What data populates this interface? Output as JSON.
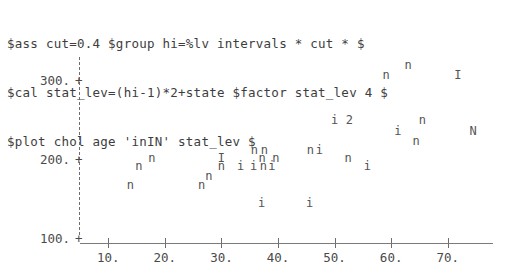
{
  "terminal": {
    "lines": [
      "$ass cut=0.4 $group hi=%lv intervals * cut * $",
      "$cal stat_lev=(hi-1)*2+state $factor stat_lev 4 $",
      "$plot chol age 'inIN' stat_lev $"
    ]
  },
  "chart_data": {
    "type": "scatter",
    "title": "",
    "xlabel": "age",
    "ylabel": "chol",
    "grid": false,
    "legend": "none",
    "plot_symbols": [
      "i",
      "n",
      "I",
      "N",
      "2"
    ],
    "xlim": [
      5,
      78
    ],
    "ylim": [
      95,
      330
    ],
    "xticks": [
      10,
      20,
      30,
      40,
      50,
      60,
      70
    ],
    "xticklabels": [
      "10.",
      "20.",
      "30.",
      "40.",
      "50.",
      "60.",
      "70."
    ],
    "yticks": [
      100,
      200,
      300
    ],
    "yticklabels": [
      "100.",
      "200.",
      "300."
    ],
    "tick_glyph": "+",
    "points": [
      {
        "symbol": "n",
        "x": 63.0,
        "y": 320
      },
      {
        "symbol": "n",
        "x": 59.1,
        "y": 307
      },
      {
        "symbol": "I",
        "x": 71.8,
        "y": 307
      },
      {
        "symbol": "i",
        "x": 50.0,
        "y": 250
      },
      {
        "symbol": "2",
        "x": 52.6,
        "y": 250
      },
      {
        "symbol": "n",
        "x": 65.5,
        "y": 250
      },
      {
        "symbol": "i",
        "x": 61.2,
        "y": 237
      },
      {
        "symbol": "N",
        "x": 74.5,
        "y": 237
      },
      {
        "symbol": "n",
        "x": 64.4,
        "y": 224
      },
      {
        "symbol": "n",
        "x": 35.8,
        "y": 213
      },
      {
        "symbol": "n",
        "x": 37.6,
        "y": 213
      },
      {
        "symbol": "n",
        "x": 45.7,
        "y": 213
      },
      {
        "symbol": "i",
        "x": 47.3,
        "y": 213
      },
      {
        "symbol": "I",
        "x": 30.0,
        "y": 203
      },
      {
        "symbol": "n",
        "x": 17.7,
        "y": 203
      },
      {
        "symbol": "n",
        "x": 37.2,
        "y": 203
      },
      {
        "symbol": "n",
        "x": 39.6,
        "y": 203
      },
      {
        "symbol": "n",
        "x": 52.4,
        "y": 203
      },
      {
        "symbol": "n",
        "x": 15.4,
        "y": 192
      },
      {
        "symbol": "n",
        "x": 30.0,
        "y": 192
      },
      {
        "symbol": "i",
        "x": 35.7,
        "y": 192
      },
      {
        "symbol": "n",
        "x": 37.4,
        "y": 192
      },
      {
        "symbol": "i",
        "x": 38.9,
        "y": 192
      },
      {
        "symbol": "i",
        "x": 33.4,
        "y": 192
      },
      {
        "symbol": "i",
        "x": 55.8,
        "y": 192
      },
      {
        "symbol": "n",
        "x": 27.8,
        "y": 180
      },
      {
        "symbol": "n",
        "x": 13.9,
        "y": 168
      },
      {
        "symbol": "n",
        "x": 26.5,
        "y": 168
      },
      {
        "symbol": "i",
        "x": 37.1,
        "y": 145
      },
      {
        "symbol": "i",
        "x": 45.6,
        "y": 145
      }
    ]
  }
}
